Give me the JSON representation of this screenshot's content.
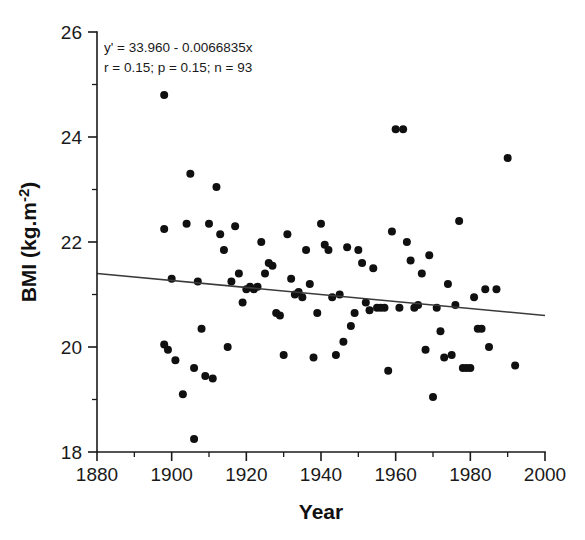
{
  "chart_data": {
    "type": "scatter",
    "title": "",
    "xlabel": "Year",
    "ylabel": "BMI (kg.m-2)",
    "ylabel_base": "BMI (kg.m",
    "ylabel_exponent": "-2",
    "ylabel_close": ")",
    "xlim": [
      1880,
      2000
    ],
    "ylim": [
      18,
      26
    ],
    "x_ticks_major": [
      1880,
      1900,
      1920,
      1940,
      1960,
      1980,
      2000
    ],
    "x_ticks_minor": [
      1890,
      1910,
      1930,
      1950,
      1970,
      1990
    ],
    "y_ticks_major": [
      18,
      20,
      22,
      24,
      26
    ],
    "y_ticks_minor": [
      19,
      21,
      23,
      25
    ],
    "grid": false,
    "legend": "none",
    "marker": "filled-circle",
    "marker_color": "#101010",
    "marker_size_px": 8,
    "annotations": [
      "y' = 33.960 - 0.0066835x",
      "r = 0.15; p = 0.15; n = 93"
    ],
    "statistics": {
      "intercept": 33.96,
      "slope": -0.0066835,
      "r": 0.15,
      "p": 0.15,
      "n": 93
    },
    "fit_line": {
      "label": "linear regression",
      "x_start": 1880,
      "y_start": 21.4,
      "x_end": 2000,
      "y_end": 20.6,
      "color": "#3a3a3a"
    },
    "x": [
      1898,
      1898,
      1898,
      1899,
      1900,
      1901,
      1903,
      1904,
      1905,
      1906,
      1906,
      1907,
      1908,
      1909,
      1910,
      1911,
      1912,
      1913,
      1914,
      1915,
      1916,
      1917,
      1918,
      1919,
      1920,
      1921,
      1922,
      1923,
      1924,
      1925,
      1926,
      1927,
      1928,
      1929,
      1930,
      1931,
      1932,
      1933,
      1934,
      1935,
      1936,
      1937,
      1938,
      1939,
      1940,
      1941,
      1942,
      1943,
      1944,
      1945,
      1946,
      1947,
      1948,
      1949,
      1950,
      1951,
      1952,
      1953,
      1954,
      1955,
      1956,
      1957,
      1958,
      1959,
      1960,
      1961,
      1962,
      1963,
      1964,
      1965,
      1966,
      1967,
      1968,
      1969,
      1970,
      1971,
      1972,
      1973,
      1974,
      1975,
      1976,
      1977,
      1978,
      1979,
      1980,
      1981,
      1982,
      1983,
      1984,
      1985,
      1987,
      1990,
      1992
    ],
    "y": [
      24.8,
      22.25,
      20.05,
      19.95,
      21.3,
      19.75,
      19.1,
      22.35,
      23.3,
      18.25,
      19.6,
      21.25,
      20.35,
      19.45,
      22.35,
      19.4,
      23.05,
      22.15,
      21.85,
      20.0,
      21.25,
      22.3,
      21.4,
      20.85,
      21.1,
      21.15,
      21.1,
      21.15,
      22.0,
      21.4,
      21.6,
      21.55,
      20.65,
      20.6,
      19.85,
      22.15,
      21.3,
      21.0,
      21.05,
      20.95,
      21.85,
      21.2,
      19.8,
      20.65,
      22.35,
      21.95,
      21.85,
      20.95,
      19.85,
      21.0,
      20.1,
      21.9,
      20.4,
      20.65,
      21.85,
      21.6,
      20.85,
      20.7,
      21.5,
      20.75,
      20.75,
      20.75,
      19.55,
      22.2,
      24.15,
      20.75,
      24.15,
      22.0,
      21.65,
      20.75,
      20.8,
      21.4,
      19.95,
      21.75,
      19.05,
      20.75,
      20.3,
      19.8,
      21.2,
      19.85,
      20.8,
      22.4,
      19.6,
      19.6,
      19.6,
      20.95,
      20.35,
      20.35,
      21.1,
      20.0,
      21.1,
      23.6,
      19.65
    ]
  }
}
